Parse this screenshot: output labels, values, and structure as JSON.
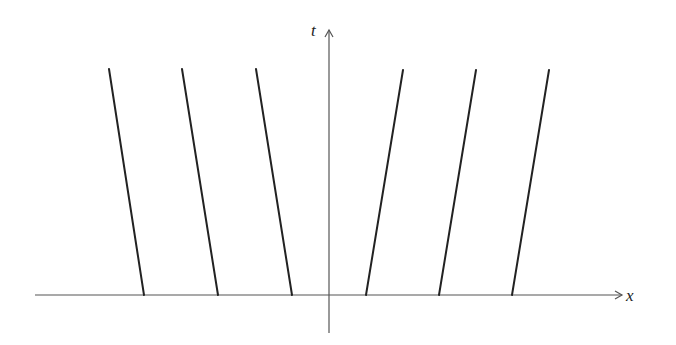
{
  "diagram": {
    "type": "spacetime-characteristics",
    "axes": {
      "horizontal": {
        "label": "x",
        "y": 295,
        "x_start": 35,
        "x_end": 622
      },
      "vertical": {
        "label": "t",
        "x": 329,
        "y_start": 333,
        "y_end": 30
      }
    },
    "colors": {
      "axis": "#555555",
      "line": "#222222",
      "background": "#ffffff"
    },
    "lines": [
      {
        "side": "left",
        "x_bottom": 144,
        "y_bottom": 295,
        "x_top": 109,
        "y_top": 69
      },
      {
        "side": "left",
        "x_bottom": 218,
        "y_bottom": 295,
        "x_top": 182,
        "y_top": 69
      },
      {
        "side": "left",
        "x_bottom": 292,
        "y_bottom": 295,
        "x_top": 256,
        "y_top": 69
      },
      {
        "side": "right",
        "x_bottom": 366,
        "y_bottom": 295,
        "x_top": 403,
        "y_top": 70
      },
      {
        "side": "right",
        "x_bottom": 439,
        "y_bottom": 295,
        "x_top": 476,
        "y_top": 70
      },
      {
        "side": "right",
        "x_bottom": 512,
        "y_bottom": 295,
        "x_top": 549,
        "y_top": 70
      }
    ]
  }
}
